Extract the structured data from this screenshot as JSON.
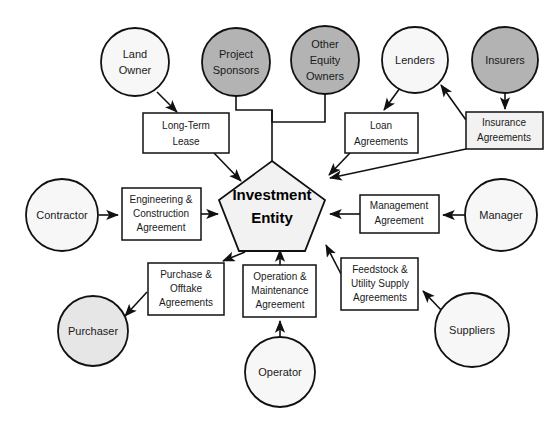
{
  "diagram": {
    "center": {
      "name": "center-node",
      "label_line1": "Investment",
      "label_line2": "Entity",
      "shape": "pentagon",
      "fill": "#f2f2f2",
      "stroke": "#111111"
    },
    "colors": {
      "shaded_party": "#b3b3b3",
      "light_party": "#f7f7f7",
      "gray_party": "#e6e6e6",
      "agreement_box": "#ffffff",
      "agreement_box_shaded": "#f2f2f2",
      "center_fill": "#f2f2f2",
      "line": "#111111",
      "text": "#1a1a1a"
    },
    "parties": [
      {
        "id": "land-owner",
        "label_lines": [
          "Land",
          "Owner"
        ],
        "cx": 135,
        "cy": 62,
        "r": 34,
        "fill": "#f7f7f7"
      },
      {
        "id": "project-sponsors",
        "label_lines": [
          "Project",
          "Sponsors"
        ],
        "cx": 236,
        "cy": 62,
        "r": 34,
        "fill": "#b3b3b3"
      },
      {
        "id": "other-equity-owners",
        "label_lines": [
          "Other",
          "Equity",
          "Owners"
        ],
        "cx": 325,
        "cy": 60,
        "r": 34,
        "fill": "#b3b3b3"
      },
      {
        "id": "lenders",
        "label_lines": [
          "Lenders"
        ],
        "cx": 415,
        "cy": 60,
        "r": 33,
        "fill": "#f7f7f7"
      },
      {
        "id": "insurers",
        "label_lines": [
          "Insurers"
        ],
        "cx": 505,
        "cy": 60,
        "r": 33,
        "fill": "#b3b3b3"
      },
      {
        "id": "contractor",
        "label_lines": [
          "Contractor"
        ],
        "cx": 62,
        "cy": 215,
        "r": 36,
        "fill": "#f7f7f7"
      },
      {
        "id": "manager",
        "label_lines": [
          "Manager"
        ],
        "cx": 501,
        "cy": 215,
        "r": 36,
        "fill": "#f7f7f7"
      },
      {
        "id": "purchaser",
        "label_lines": [
          "Purchaser"
        ],
        "cx": 93,
        "cy": 331,
        "r": 35,
        "fill": "#e6e6e6"
      },
      {
        "id": "operator",
        "label_lines": [
          "Operator"
        ],
        "cx": 280,
        "cy": 372,
        "r": 35,
        "fill": "#f7f7f7"
      },
      {
        "id": "suppliers",
        "label_lines": [
          "Suppliers"
        ],
        "cx": 472,
        "cy": 330,
        "r": 37,
        "fill": "#f7f7f7"
      }
    ],
    "agreements": [
      {
        "id": "long-term-lease",
        "label_lines": [
          "Long-Term",
          "Lease"
        ],
        "x": 143,
        "y": 113,
        "w": 86,
        "h": 40,
        "fill": "#ffffff"
      },
      {
        "id": "loan-agreements",
        "label_lines": [
          "Loan",
          "Agreements"
        ],
        "x": 345,
        "y": 113,
        "w": 73,
        "h": 40,
        "fill": "#ffffff"
      },
      {
        "id": "insurance-agreements",
        "label_lines": [
          "Insurance",
          "Agreements"
        ],
        "x": 466,
        "y": 112,
        "w": 77,
        "h": 37,
        "fill": "#f2f2f2"
      },
      {
        "id": "engineering-construction",
        "label_lines": [
          "Engineering &",
          "Construction",
          "Agreement"
        ],
        "x": 122,
        "y": 188,
        "w": 79,
        "h": 52,
        "fill": "#ffffff"
      },
      {
        "id": "management-agreement",
        "label_lines": [
          "Management",
          "Agreement"
        ],
        "x": 360,
        "y": 195,
        "w": 79,
        "h": 38,
        "fill": "#ffffff"
      },
      {
        "id": "purchase-offtake",
        "label_lines": [
          "Purchase &",
          "Offtake",
          "Agreements"
        ],
        "x": 148,
        "y": 263,
        "w": 76,
        "h": 52,
        "fill": "#ffffff"
      },
      {
        "id": "operation-maintenance",
        "label_lines": [
          "Operation &",
          "Maintenance",
          "Agreement"
        ],
        "x": 243,
        "y": 265,
        "w": 73,
        "h": 52,
        "fill": "#ffffff"
      },
      {
        "id": "feedstock-utility-supply",
        "label_lines": [
          "Feedstock &",
          "Utility Supply",
          "Agreements"
        ],
        "x": 341,
        "y": 258,
        "w": 77,
        "h": 52,
        "fill": "#ffffff"
      }
    ],
    "connections": [
      {
        "id": "land-owner-to-lease",
        "from": "land-owner",
        "to": "long-term-lease",
        "arrow": "to"
      },
      {
        "id": "lease-to-center",
        "from": "long-term-lease",
        "to": "center-node",
        "arrow": "to"
      },
      {
        "id": "sponsors-equity-bracket-to-center",
        "from": "project-sponsors+other-equity-owners",
        "to": "center-node",
        "arrow": "none"
      },
      {
        "id": "lenders-to-loan",
        "from": "lenders",
        "to": "loan-agreements",
        "arrow": "to"
      },
      {
        "id": "loan-to-center",
        "from": "loan-agreements",
        "to": "center-node",
        "arrow": "to"
      },
      {
        "id": "insurers-to-insurance",
        "from": "insurers",
        "to": "insurance-agreements",
        "arrow": "to"
      },
      {
        "id": "insurance-to-lenders",
        "from": "insurance-agreements",
        "to": "lenders",
        "arrow": "to"
      },
      {
        "id": "insurance-to-center",
        "from": "insurance-agreements",
        "to": "center-node",
        "arrow": "to"
      },
      {
        "id": "contractor-to-engineering",
        "from": "contractor",
        "to": "engineering-construction",
        "arrow": "to"
      },
      {
        "id": "engineering-to-center",
        "from": "engineering-construction",
        "to": "center-node",
        "arrow": "to"
      },
      {
        "id": "manager-to-management",
        "from": "manager",
        "to": "management-agreement",
        "arrow": "to"
      },
      {
        "id": "management-to-center",
        "from": "management-agreement",
        "to": "center-node",
        "arrow": "to"
      },
      {
        "id": "center-to-purchase",
        "from": "center-node",
        "to": "purchase-offtake",
        "arrow": "to"
      },
      {
        "id": "purchase-to-purchaser",
        "from": "purchase-offtake",
        "to": "purchaser",
        "arrow": "to"
      },
      {
        "id": "operator-to-operation",
        "from": "operator",
        "to": "operation-maintenance",
        "arrow": "to"
      },
      {
        "id": "operation-to-center",
        "from": "operation-maintenance",
        "to": "center-node",
        "arrow": "to"
      },
      {
        "id": "suppliers-to-feedstock",
        "from": "suppliers",
        "to": "feedstock-utility-supply",
        "arrow": "to"
      },
      {
        "id": "feedstock-to-center",
        "from": "feedstock-utility-supply",
        "to": "center-node",
        "arrow": "to"
      }
    ]
  }
}
